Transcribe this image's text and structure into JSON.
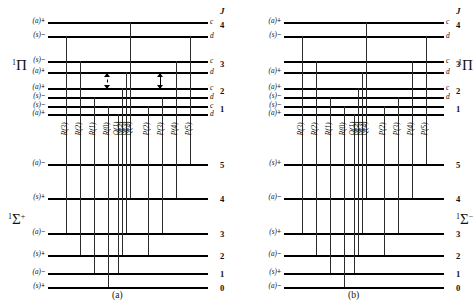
{
  "figure": {
    "jheader": "J",
    "captions": {
      "a": "(a)",
      "b": "(b)"
    }
  },
  "panel_a": {
    "caption": "(a)",
    "upper_term": "¹Π",
    "lower_term": "¹Σ⁺",
    "upper_levels": [
      {
        "J": "4",
        "cd": "c",
        "parity": "(a)",
        "sign": "+"
      },
      {
        "J": "",
        "cd": "d",
        "parity": "(s)",
        "sign": "−"
      },
      {
        "J": "3",
        "cd": "c",
        "parity": "(s)",
        "sign": "−"
      },
      {
        "J": "",
        "cd": "d",
        "parity": "(a)",
        "sign": "+"
      },
      {
        "J": "2",
        "cd": "c",
        "parity": "(a)",
        "sign": "+"
      },
      {
        "J": "",
        "cd": "d",
        "parity": "(s)",
        "sign": "−"
      },
      {
        "J": "1",
        "cd": "c",
        "parity": "(s)",
        "sign": "−"
      },
      {
        "J": "",
        "cd": "d",
        "parity": "(a)",
        "sign": "+"
      }
    ],
    "lower_levels": [
      {
        "J": "5",
        "parity": "(a)",
        "sign": "−"
      },
      {
        "J": "4",
        "parity": "(s)",
        "sign": "+"
      },
      {
        "J": "3",
        "parity": "(a)",
        "sign": "−"
      },
      {
        "J": "2",
        "parity": "(s)",
        "sign": "+"
      },
      {
        "J": "1",
        "parity": "(a)",
        "sign": "−"
      },
      {
        "J": "0",
        "parity": "(s)",
        "sign": "+"
      }
    ],
    "branches": [
      "R(3)",
      "R(2)",
      "R(1)",
      "R(0)",
      "Q(1)",
      "Q(2)",
      "Q(3)",
      "Q(4)",
      "P(2)",
      "P(3)",
      "P(4)",
      "P(5)"
    ]
  },
  "panel_b": {
    "caption": "(b)",
    "upper_term": "¹Π",
    "lower_term": "¹Σ⁻",
    "upper_levels": [
      {
        "J": "4",
        "cd": "c",
        "parity": "(a)",
        "sign": "+"
      },
      {
        "J": "",
        "cd": "d",
        "parity": "(s)",
        "sign": "−"
      },
      {
        "J": "3",
        "cd": "c",
        "parity": "",
        "sign": ""
      },
      {
        "J": "",
        "cd": "d",
        "parity": "(a)",
        "sign": "+"
      },
      {
        "J": "2",
        "cd": "c",
        "parity": "(a)",
        "sign": "+"
      },
      {
        "J": "",
        "cd": "d",
        "parity": "(s)",
        "sign": "−"
      },
      {
        "J": "1",
        "cd": "",
        "parity": "(s)",
        "sign": "−"
      },
      {
        "J": "",
        "cd": "",
        "parity": "(a)",
        "sign": "+"
      }
    ],
    "lower_levels": [
      {
        "J": "5",
        "parity": "(s)",
        "sign": "+"
      },
      {
        "J": "4",
        "parity": "(a)",
        "sign": "−"
      },
      {
        "J": "3",
        "parity": "(s)",
        "sign": "+"
      },
      {
        "J": "2",
        "parity": "(a)",
        "sign": "−"
      },
      {
        "J": "1",
        "parity": "(s)",
        "sign": "+"
      },
      {
        "J": "0",
        "parity": "(a)",
        "sign": "−"
      }
    ],
    "branches": [
      "R(3)",
      "R(2)",
      "R(1)",
      "R(0)",
      "Q(1)",
      "Q(2)",
      "Q(3)",
      "Q(4)",
      "P(2)",
      "P(3)",
      "P(4)",
      "P(5)"
    ]
  }
}
